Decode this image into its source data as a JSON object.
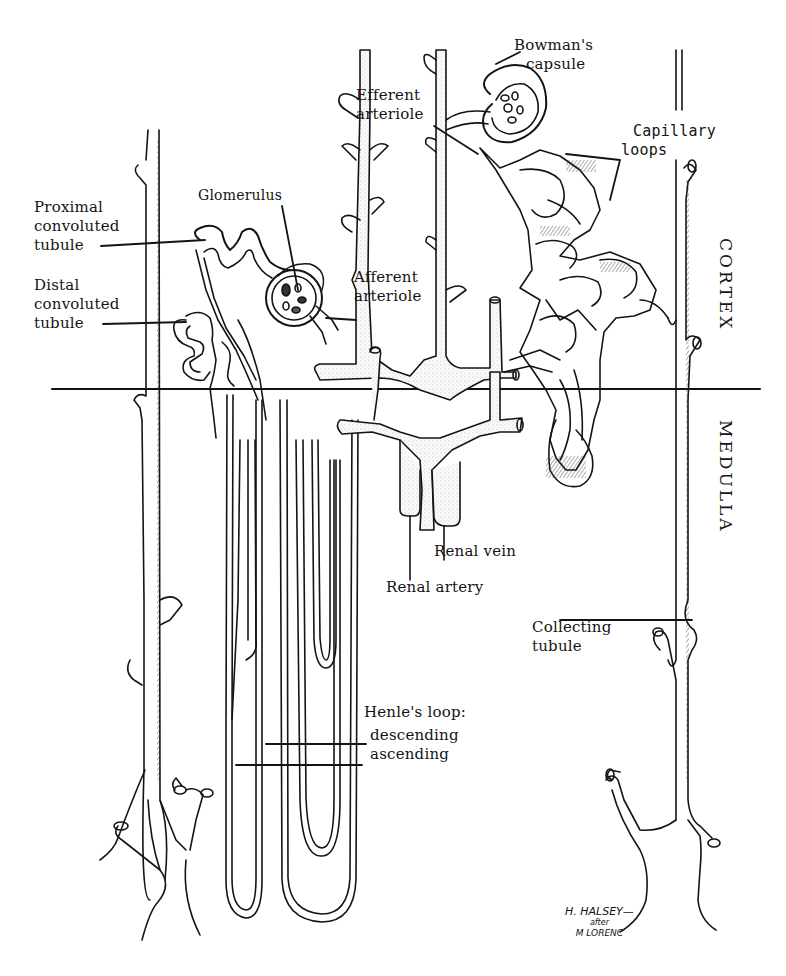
{
  "diagram": {
    "colors": {
      "ink": "#141414",
      "background": "#ffffff",
      "stipple": "#e9e9e9"
    },
    "regions": {
      "cortex": "CORTEX",
      "medulla": "MEDULLA"
    },
    "labels": {
      "bowmans_capsule": [
        "Bowman's",
        "capsule"
      ],
      "efferent_arteriole": [
        "Efferent",
        "arteriole"
      ],
      "capillary_loops": [
        "Capillary",
        "loops"
      ],
      "glomerulus": [
        "Glomerulus"
      ],
      "proximal_convoluted_tubule": [
        "Proximal",
        "convoluted",
        "tubule"
      ],
      "distal_convoluted_tubule": [
        "Distal",
        "convoluted",
        "tubule"
      ],
      "afferent_arteriole": [
        "Afferent",
        "arteriole"
      ],
      "renal_vein": [
        "Renal vein"
      ],
      "renal_artery": [
        "Renal artery"
      ],
      "collecting_tubule": [
        "Collecting",
        "tubule"
      ],
      "henles_loop": {
        "title": "Henle's loop:",
        "descending": "descending",
        "ascending": "ascending"
      }
    },
    "signature": {
      "line1": "H. HALSEY—",
      "line2": "after",
      "line3": "M LORENC"
    }
  }
}
